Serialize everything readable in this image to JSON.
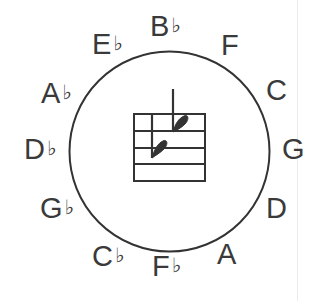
{
  "diagram": {
    "type": "circle-of-fifths",
    "circle": {
      "cx": 169.5,
      "cy": 151.5,
      "r": 100,
      "stroke": "#333333"
    },
    "center_staff": {
      "description": "staff with two flat signs (key signature: 2 flats)",
      "line_color": "#333333"
    },
    "keys": [
      {
        "id": "bflat",
        "letter": "B",
        "accidental": "♭",
        "x": 150,
        "y": 12
      },
      {
        "id": "f",
        "letter": "F",
        "accidental": "",
        "x": 221,
        "y": 31
      },
      {
        "id": "c",
        "letter": "C",
        "accidental": "",
        "x": 266,
        "y": 76
      },
      {
        "id": "g",
        "letter": "G",
        "accidental": "",
        "x": 282,
        "y": 135
      },
      {
        "id": "d",
        "letter": "D",
        "accidental": "",
        "x": 266,
        "y": 194
      },
      {
        "id": "a",
        "letter": "A",
        "accidental": "",
        "x": 217,
        "y": 240
      },
      {
        "id": "fflat",
        "letter": "F",
        "accidental": "♭",
        "x": 152,
        "y": 252
      },
      {
        "id": "cflat",
        "letter": "C",
        "accidental": "♭",
        "x": 92,
        "y": 242
      },
      {
        "id": "gflat",
        "letter": "G",
        "accidental": "♭",
        "x": 40,
        "y": 194
      },
      {
        "id": "dflat",
        "letter": "D",
        "accidental": "♭",
        "x": 24,
        "y": 135
      },
      {
        "id": "aflat",
        "letter": "A",
        "accidental": "♭",
        "x": 41,
        "y": 79
      },
      {
        "id": "eflat",
        "letter": "E",
        "accidental": "♭",
        "x": 92,
        "y": 30
      }
    ]
  }
}
